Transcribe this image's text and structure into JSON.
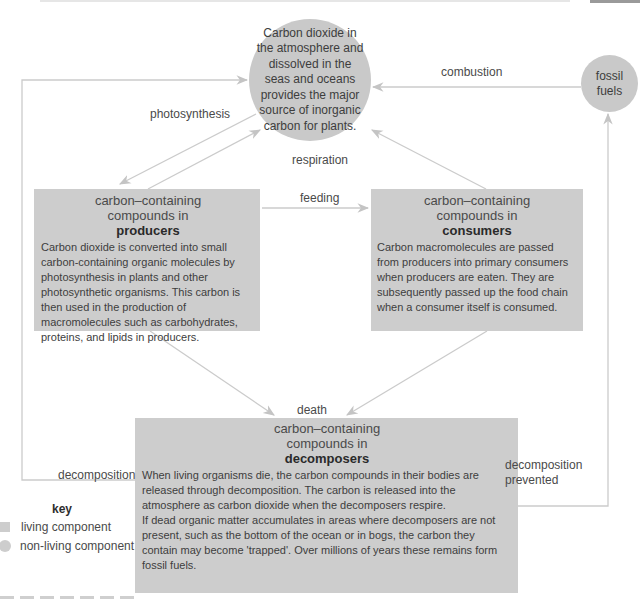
{
  "diagram": {
    "nodes": {
      "atmosphere": {
        "type": "non-living",
        "text": "Carbon dioxide in the atmosphere and dissolved in the seas and oceans provides the major source of inorganic carbon for plants."
      },
      "fossil_fuels": {
        "type": "non-living",
        "text": "fossil fuels"
      },
      "producers": {
        "type": "living",
        "title": "carbon–containing compounds in",
        "heading": "producers",
        "body": "Carbon dioxide is converted into small carbon-containing organic molecules by photosynthesis in plants and other photosynthetic organisms. This carbon is then used in the production of macromolecules such as carbohydrates, proteins, and lipids in producers."
      },
      "consumers": {
        "type": "living",
        "title": "carbon–containing compounds in",
        "heading": "consumers",
        "body": "Carbon macromolecules are passed from producers into primary consumers when producers are eaten. They are subsequently passed up the food chain when a consumer itself is consumed."
      },
      "decomposers": {
        "type": "living",
        "title": "carbon–containing compounds in",
        "heading": "decomposers",
        "body1": "When living organisms die, the carbon compounds in their bodies are released through decomposition. The carbon is released into the atmosphere as carbon dioxide when the decomposers respire.",
        "body2": "If dead organic matter accumulates in areas where decomposers are not present, such as the bottom of the ocean or in bogs, the carbon they contain may become 'trapped'. Over millions of years these remains form fossil fuels."
      }
    },
    "edges": {
      "photosynthesis": "photosynthesis",
      "respiration": "respiration",
      "combustion": "combustion",
      "feeding": "feeding",
      "death": "death",
      "decomposition": "decomposition",
      "decomposition_prevented_1": "decomposition",
      "decomposition_prevented_2": "prevented"
    },
    "key": {
      "title": "key",
      "living": "living component",
      "non_living": "non-living component"
    },
    "colors": {
      "shape_fill": "#cdcdcd",
      "arrow": "#c8c8c8",
      "text": "#3d3d3d"
    }
  }
}
